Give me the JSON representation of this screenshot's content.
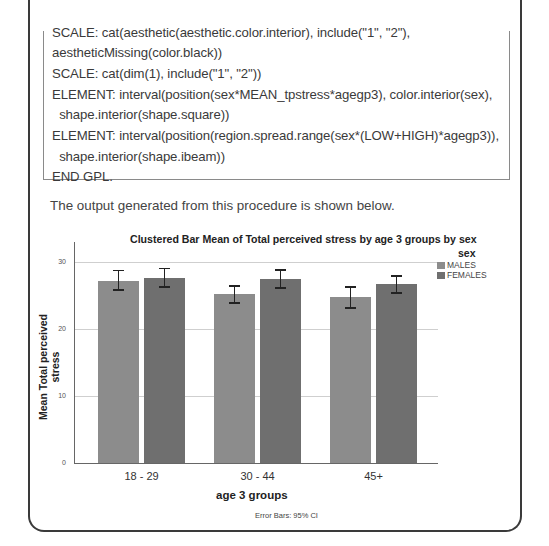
{
  "code_block": {
    "lines": [
      "SCALE: cat(aesthetic(aesthetic.color.interior), include(\"1\", \"2\"),",
      "aestheticMissing(color.black))",
      "SCALE: cat(dim(1), include(\"1\", \"2\"))",
      "ELEMENT: interval(position(sex*MEAN_tpstress*agegp3), color.interior(sex),",
      "  shape.interior(shape.square))",
      "ELEMENT: interval(position(region.spread.range(sex*(LOW+HIGH)*agegp3)),",
      "  shape.interior(shape.ibeam))",
      "END GPL."
    ]
  },
  "intro_text": "The output generated from this procedure is shown below.",
  "colors": {
    "males": "#8c8c8c",
    "females": "#6f6f6f",
    "gridline": "#cfcfcf",
    "axis": "#666666"
  },
  "chart_data": {
    "type": "bar",
    "title": "Clustered Bar Mean of Total perceived stress by age 3 groups by sex",
    "xlabel": "age 3 groups",
    "ylabel": "Mean Total perceived stress",
    "categories": [
      "18 - 29",
      "30 - 44",
      "45+"
    ],
    "series": [
      {
        "name": "MALES",
        "values": [
          27.2,
          25.2,
          24.8
        ],
        "ci_low": [
          25.8,
          23.9,
          23.1
        ],
        "ci_high": [
          28.7,
          26.4,
          26.3
        ]
      },
      {
        "name": "FEMALES",
        "values": [
          27.6,
          27.5,
          26.7
        ],
        "ci_low": [
          26.3,
          26.1,
          25.4
        ],
        "ci_high": [
          29.0,
          28.8,
          27.9
        ]
      }
    ],
    "ylim": [
      0,
      33
    ],
    "yticks": [
      0,
      10,
      20,
      30
    ],
    "grid": true,
    "legend_title": "sex",
    "legend_position": "right",
    "annotation": "Error Bars: 95% CI"
  }
}
